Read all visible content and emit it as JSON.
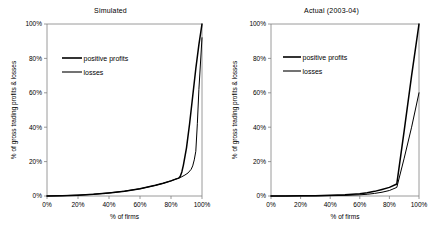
{
  "figure": {
    "panels": [
      {
        "id": "simulated",
        "title": "Simulated",
        "legend": [
          {
            "key": "positive_profits",
            "label": "positive profits"
          },
          {
            "key": "losses",
            "label": "losses"
          }
        ],
        "axes": {
          "xlabel": "% of firms",
          "ylabel": "% of gross trading profits & losses",
          "xticks": [
            "0%",
            "20%",
            "40%",
            "60%",
            "80%",
            "100%"
          ],
          "yticks": [
            "0%",
            "20%",
            "40%",
            "60%",
            "80%",
            "100%"
          ]
        }
      },
      {
        "id": "actual",
        "title": "Actual (2003-04)",
        "legend": [
          {
            "key": "positive_profits",
            "label": "positive profits"
          },
          {
            "key": "losses",
            "label": "losses"
          }
        ],
        "axes": {
          "xlabel": "% of firms",
          "ylabel": "% of gross trading profits & losses",
          "xticks": [
            "0%",
            "20%",
            "40%",
            "60%",
            "80%",
            "100%"
          ],
          "yticks": [
            "0%",
            "20%",
            "40%",
            "60%",
            "80%",
            "100%"
          ]
        }
      }
    ]
  },
  "colors": {
    "line": "#000000",
    "axis": "#808080",
    "background": "#ffffff"
  },
  "chart_data": [
    {
      "type": "line",
      "title": "Simulated",
      "xlabel": "% of firms",
      "ylabel": "% of gross trading profits & losses",
      "xlim": [
        0,
        100
      ],
      "ylim": [
        0,
        100
      ],
      "xticks": [
        0,
        20,
        40,
        60,
        80,
        100
      ],
      "yticks": [
        0,
        20,
        40,
        60,
        80,
        100
      ],
      "grid": false,
      "legend_position": "upper-left",
      "series": [
        {
          "name": "positive profits",
          "x": [
            0,
            10,
            20,
            30,
            40,
            50,
            60,
            70,
            75,
            80,
            83,
            85,
            86,
            87,
            88,
            90,
            92,
            94,
            96,
            98,
            100
          ],
          "y": [
            0,
            0.2,
            0.5,
            1.0,
            1.8,
            2.8,
            4.2,
            6.2,
            7.4,
            8.8,
            9.8,
            10.4,
            11.5,
            14,
            18,
            28,
            42,
            58,
            74,
            88,
            100
          ]
        },
        {
          "name": "losses",
          "x": [
            0,
            10,
            20,
            30,
            40,
            50,
            60,
            70,
            75,
            80,
            83,
            85,
            87,
            89,
            91,
            93,
            94,
            95,
            96,
            97,
            98,
            100
          ],
          "y": [
            0,
            0.2,
            0.5,
            1.0,
            1.8,
            2.8,
            4.2,
            6.2,
            7.4,
            8.8,
            9.8,
            10.4,
            11.2,
            12.2,
            13.4,
            15.5,
            17.5,
            21,
            26,
            42,
            62,
            92
          ]
        }
      ]
    },
    {
      "type": "line",
      "title": "Actual (2003-04)",
      "xlabel": "% of firms",
      "ylabel": "% of gross trading profits & losses",
      "xlim": [
        0,
        100
      ],
      "ylim": [
        0,
        100
      ],
      "xticks": [
        0,
        20,
        40,
        60,
        80,
        100
      ],
      "yticks": [
        0,
        20,
        40,
        60,
        80,
        100
      ],
      "grid": false,
      "legend_position": "upper-left",
      "series": [
        {
          "name": "positive profits",
          "x": [
            0,
            10,
            20,
            30,
            40,
            50,
            60,
            65,
            70,
            75,
            80,
            85,
            90,
            95,
            100
          ],
          "y": [
            0,
            0.05,
            0.1,
            0.2,
            0.4,
            0.7,
            1.3,
            1.9,
            2.7,
            3.8,
            5.0,
            7.0,
            38,
            70,
            100
          ]
        },
        {
          "name": "losses",
          "x": [
            0,
            10,
            20,
            30,
            40,
            50,
            60,
            65,
            70,
            75,
            80,
            85,
            90,
            95,
            100
          ],
          "y": [
            0,
            0.02,
            0.05,
            0.1,
            0.2,
            0.35,
            0.7,
            1.0,
            1.5,
            2.2,
            3.2,
            5.0,
            22,
            40,
            60
          ]
        }
      ]
    }
  ]
}
